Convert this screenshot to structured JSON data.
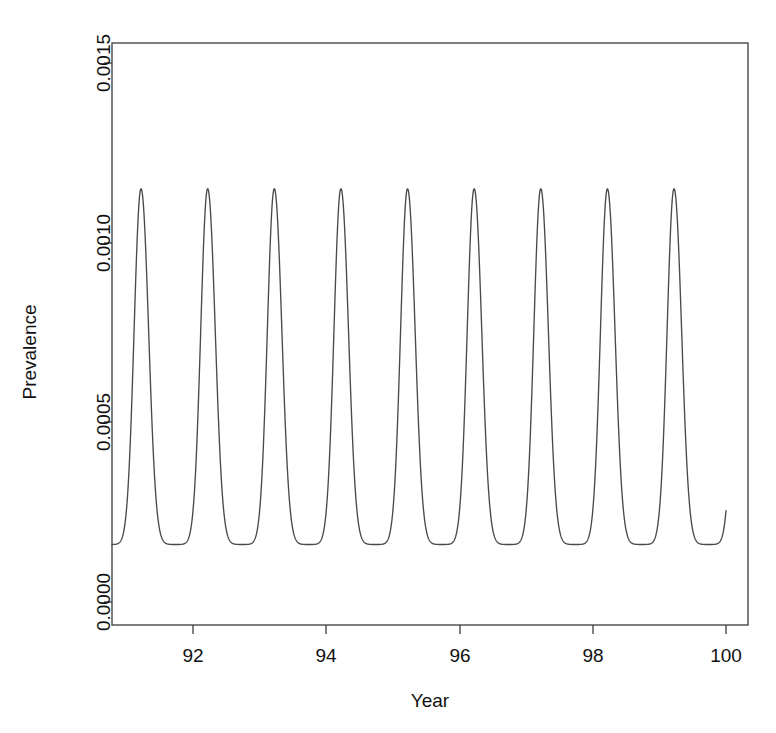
{
  "figure": {
    "header_fragment": "",
    "background_color": "#ffffff",
    "line_color": "#4a4a4a",
    "axis_color": "#3b3b3b"
  },
  "chart_data": {
    "type": "line",
    "title": "",
    "xlabel": "Year",
    "ylabel": "Prevalence",
    "xlim": [
      90.65,
      100.3
    ],
    "ylim": [
      -6e-05,
      0.001617
    ],
    "grid": false,
    "legend": null,
    "xticks": [
      92,
      94,
      96,
      98,
      100
    ],
    "xtick_labels": [
      "92",
      "94",
      "96",
      "98",
      "100"
    ],
    "yticks": [
      0.0,
      0.0005,
      0.001,
      0.0015
    ],
    "ytick_labels": [
      "0.0000",
      "0.0005",
      "0.0010",
      "0.0015"
    ],
    "series": [
      {
        "name": "Prevalence",
        "color": "#4a4a4a",
        "description": "Annual seasonal epidemic oscillation: sharp asymmetric peaks once per year, period 1.0 year, peak prevalence ~0.00115, trough prevalence ~0.00016",
        "period_years": 1.0,
        "peak_value": 0.00115,
        "trough_value": 0.00016,
        "first_peak_year": 91.22,
        "peak_years": [
          91.22,
          92.22,
          93.22,
          94.22,
          95.22,
          96.22,
          97.22,
          98.22,
          99.22
        ],
        "peak_values": [
          0.00115,
          0.00115,
          0.00115,
          0.00115,
          0.00115,
          0.00115,
          0.00115,
          0.00115,
          0.00115
        ],
        "trough_years": [
          90.82,
          91.82,
          92.82,
          93.82,
          94.82,
          95.82,
          96.82,
          97.82,
          98.82,
          99.82
        ],
        "trough_values": [
          0.00016,
          0.00016,
          0.00016,
          0.00016,
          0.00016,
          0.00016,
          0.00016,
          0.00016,
          0.00016,
          0.00016
        ],
        "x_start": 90.68,
        "y_start": 0.00019,
        "x_end": 100.0,
        "y_end": 0.00042
      }
    ]
  }
}
